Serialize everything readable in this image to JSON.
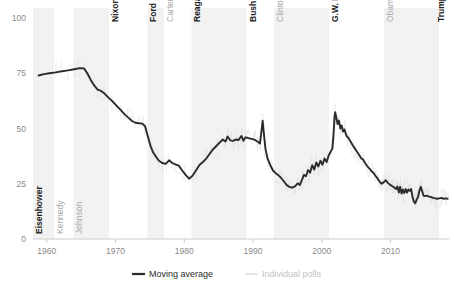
{
  "chart_data": {
    "type": "line",
    "title": "",
    "subtitle": "",
    "xlabel": "",
    "ylabel": "",
    "xlim": [
      1958.0,
      2018.5
    ],
    "ylim": [
      0,
      100
    ],
    "grid": false,
    "legend_position": "bottom-center",
    "x_ticks": [
      "1960",
      "1970",
      "1980",
      "1990",
      "2000",
      "2010"
    ],
    "x_tick_values": [
      1960,
      1970,
      1980,
      1990,
      2000,
      2010
    ],
    "y_ticks": [
      "0",
      "25",
      "50",
      "75",
      "100"
    ],
    "y_tick_values": [
      0,
      25,
      50,
      75,
      100
    ],
    "legend": [
      {
        "name": "Moving average",
        "color": "#2b2b2b",
        "style": "solid-thick"
      },
      {
        "name": "Individual polls",
        "color": "#d8d8d8",
        "style": "solid-thin"
      }
    ],
    "series": [
      {
        "name": "Moving average",
        "color": "#2b2b2b",
        "points": [
          [
            1958.8,
            74.0
          ],
          [
            1959.6,
            74.6
          ],
          [
            1960.4,
            75.0
          ],
          [
            1961.3,
            75.4
          ],
          [
            1962.2,
            75.9
          ],
          [
            1963.1,
            76.3
          ],
          [
            1964.0,
            76.8
          ],
          [
            1964.8,
            77.3
          ],
          [
            1965.4,
            77.2
          ],
          [
            1965.9,
            75.0
          ],
          [
            1966.4,
            72.0
          ],
          [
            1966.9,
            69.5
          ],
          [
            1967.4,
            67.6
          ],
          [
            1967.9,
            67.0
          ],
          [
            1968.4,
            65.8
          ],
          [
            1968.9,
            64.2
          ],
          [
            1969.5,
            62.5
          ],
          [
            1970.1,
            60.5
          ],
          [
            1970.7,
            58.5
          ],
          [
            1971.3,
            56.5
          ],
          [
            1971.9,
            54.8
          ],
          [
            1972.4,
            53.4
          ],
          [
            1972.9,
            52.6
          ],
          [
            1973.4,
            52.4
          ],
          [
            1973.9,
            52.2
          ],
          [
            1974.3,
            51.0
          ],
          [
            1974.7,
            46.5
          ],
          [
            1975.1,
            42.0
          ],
          [
            1975.5,
            39.0
          ],
          [
            1975.9,
            37.2
          ],
          [
            1976.3,
            35.4
          ],
          [
            1976.8,
            34.4
          ],
          [
            1977.3,
            34.0
          ],
          [
            1977.8,
            35.6
          ],
          [
            1978.2,
            34.5
          ],
          [
            1978.7,
            33.8
          ],
          [
            1979.2,
            33.2
          ],
          [
            1979.7,
            31.0
          ],
          [
            1980.2,
            29.0
          ],
          [
            1980.7,
            27.3
          ],
          [
            1981.2,
            28.6
          ],
          [
            1981.7,
            31.0
          ],
          [
            1982.2,
            33.5
          ],
          [
            1982.7,
            34.8
          ],
          [
            1983.2,
            36.4
          ],
          [
            1983.7,
            38.6
          ],
          [
            1984.2,
            40.6
          ],
          [
            1984.7,
            42.2
          ],
          [
            1985.2,
            43.8
          ],
          [
            1985.6,
            45.0
          ],
          [
            1986.0,
            44.1
          ],
          [
            1986.3,
            46.4
          ],
          [
            1986.7,
            44.6
          ],
          [
            1987.1,
            44.4
          ],
          [
            1987.5,
            45.0
          ],
          [
            1987.9,
            44.8
          ],
          [
            1988.3,
            46.6
          ],
          [
            1988.6,
            44.5
          ],
          [
            1988.9,
            46.0
          ],
          [
            1989.2,
            45.8
          ],
          [
            1989.6,
            45.4
          ],
          [
            1990.0,
            45.2
          ],
          [
            1990.4,
            44.6
          ],
          [
            1990.8,
            43.8
          ],
          [
            1991.0,
            43.2
          ],
          [
            1991.2,
            48.0
          ],
          [
            1991.4,
            53.5
          ],
          [
            1991.6,
            47.0
          ],
          [
            1991.8,
            41.0
          ],
          [
            1992.1,
            36.5
          ],
          [
            1992.5,
            33.5
          ],
          [
            1992.9,
            31.0
          ],
          [
            1993.3,
            29.8
          ],
          [
            1993.7,
            28.8
          ],
          [
            1994.1,
            27.6
          ],
          [
            1994.5,
            26.0
          ],
          [
            1994.9,
            24.4
          ],
          [
            1995.3,
            23.6
          ],
          [
            1995.7,
            23.2
          ],
          [
            1996.1,
            23.8
          ],
          [
            1996.5,
            25.2
          ],
          [
            1996.8,
            24.4
          ],
          [
            1997.1,
            26.6
          ],
          [
            1997.4,
            29.0
          ],
          [
            1997.7,
            28.4
          ],
          [
            1998.0,
            31.2
          ],
          [
            1998.3,
            30.0
          ],
          [
            1998.6,
            33.4
          ],
          [
            1998.9,
            31.4
          ],
          [
            1999.2,
            34.6
          ],
          [
            1999.5,
            32.8
          ],
          [
            1999.8,
            35.4
          ],
          [
            2000.1,
            33.6
          ],
          [
            2000.4,
            36.4
          ],
          [
            2000.7,
            34.8
          ],
          [
            2001.0,
            37.8
          ],
          [
            2001.3,
            39.6
          ],
          [
            2001.55,
            41.0
          ],
          [
            2001.72,
            48.0
          ],
          [
            2001.85,
            55.0
          ],
          [
            2001.95,
            57.4
          ],
          [
            2002.1,
            55.0
          ],
          [
            2002.3,
            52.0
          ],
          [
            2002.5,
            53.6
          ],
          [
            2002.7,
            50.0
          ],
          [
            2002.9,
            51.4
          ],
          [
            2003.1,
            48.6
          ],
          [
            2003.3,
            49.6
          ],
          [
            2003.6,
            46.6
          ],
          [
            2003.9,
            45.6
          ],
          [
            2004.2,
            44.0
          ],
          [
            2004.5,
            42.4
          ],
          [
            2004.8,
            41.0
          ],
          [
            2005.1,
            39.6
          ],
          [
            2005.4,
            38.2
          ],
          [
            2005.7,
            36.6
          ],
          [
            2006.0,
            36.0
          ],
          [
            2006.3,
            34.4
          ],
          [
            2006.6,
            33.0
          ],
          [
            2006.9,
            32.0
          ],
          [
            2007.2,
            30.8
          ],
          [
            2007.5,
            30.0
          ],
          [
            2007.8,
            28.6
          ],
          [
            2008.1,
            27.4
          ],
          [
            2008.4,
            26.0
          ],
          [
            2008.7,
            25.0
          ],
          [
            2009.0,
            25.6
          ],
          [
            2009.3,
            26.6
          ],
          [
            2009.6,
            25.4
          ],
          [
            2009.9,
            24.6
          ],
          [
            2010.2,
            24.0
          ],
          [
            2010.5,
            23.4
          ],
          [
            2010.8,
            22.6
          ],
          [
            2011.0,
            23.8
          ],
          [
            2011.2,
            21.0
          ],
          [
            2011.4,
            23.6
          ],
          [
            2011.6,
            20.6
          ],
          [
            2011.8,
            22.4
          ],
          [
            2012.0,
            20.8
          ],
          [
            2012.2,
            22.6
          ],
          [
            2012.4,
            21.0
          ],
          [
            2012.6,
            22.4
          ],
          [
            2012.8,
            21.8
          ],
          [
            2013.0,
            22.6
          ],
          [
            2013.2,
            19.0
          ],
          [
            2013.4,
            16.8
          ],
          [
            2013.6,
            16.2
          ],
          [
            2013.8,
            17.8
          ],
          [
            2014.0,
            19.0
          ],
          [
            2014.2,
            21.8
          ],
          [
            2014.4,
            23.6
          ],
          [
            2014.6,
            21.6
          ],
          [
            2014.8,
            19.6
          ],
          [
            2015.0,
            19.4
          ],
          [
            2015.3,
            19.6
          ],
          [
            2015.6,
            19.2
          ],
          [
            2015.9,
            19.0
          ],
          [
            2016.2,
            18.6
          ],
          [
            2016.5,
            18.4
          ],
          [
            2016.8,
            18.2
          ],
          [
            2017.1,
            18.4
          ],
          [
            2017.4,
            18.6
          ],
          [
            2017.7,
            18.2
          ],
          [
            2018.0,
            18.4
          ],
          [
            2018.3,
            18.2
          ]
        ]
      }
    ],
    "presidential_terms": [
      {
        "name": "Eisenhower",
        "party": "rep",
        "start": 1958.0,
        "end": 1961.05,
        "shaded": true
      },
      {
        "name": "Kennedy",
        "party": "dem",
        "start": 1961.05,
        "end": 1963.88,
        "shaded": false
      },
      {
        "name": "Johnson",
        "party": "dem",
        "start": 1963.88,
        "end": 1969.05,
        "shaded": true
      },
      {
        "name": "Nixon",
        "party": "rep",
        "start": 1969.05,
        "end": 1974.62,
        "shaded": false
      },
      {
        "name": "Ford",
        "party": "rep",
        "start": 1974.62,
        "end": 1977.05,
        "shaded": true
      },
      {
        "name": "Carter",
        "party": "dem",
        "start": 1977.05,
        "end": 1981.05,
        "shaded": false
      },
      {
        "name": "Reagan",
        "party": "rep",
        "start": 1981.05,
        "end": 1989.05,
        "shaded": true
      },
      {
        "name": "Bush",
        "party": "rep",
        "start": 1989.05,
        "end": 1993.05,
        "shaded": false
      },
      {
        "name": "Clinton",
        "party": "dem",
        "start": 1993.05,
        "end": 2001.05,
        "shaded": true
      },
      {
        "name": "G.W. Bush",
        "party": "rep",
        "start": 2001.05,
        "end": 2009.05,
        "shaded": false
      },
      {
        "name": "Obama",
        "party": "dem",
        "start": 2009.05,
        "end": 2017.05,
        "shaded": true
      },
      {
        "name": "Trump",
        "party": "rep",
        "start": 2017.05,
        "end": 2018.5,
        "shaded": false
      }
    ]
  },
  "colors": {
    "line": "#2b2b2b",
    "polls": "#d8d8d8",
    "band": "#f2f2f2",
    "axis": "#cccccc",
    "tick_text": "#8a8a8a",
    "republican_text": "#1c1c1c",
    "democrat_text": "#a8a8a8"
  }
}
